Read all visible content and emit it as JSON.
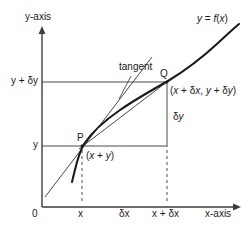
{
  "figure": {
    "colors": {
      "axis": "#3d3d3d",
      "curve": "#1a1a1a",
      "tangent": "#4a4a4a",
      "chord": "#4a4a4a",
      "guide": "#4a4a4a",
      "dashed": "#4a4a4a",
      "text": "#1a1a1a",
      "background": "#ffffff"
    },
    "axes": {
      "y_axis_label": "y-axis",
      "x_axis_label": "x-axis",
      "origin_label": "0"
    },
    "curve_label": "y = f(x)",
    "tangent_label": "tangent",
    "points": {
      "p_label": "P",
      "q_label": "Q",
      "p_coords_label": "(x + y)",
      "q_coords_label": "(x + δx, y + δy)"
    },
    "y_ticks": [
      {
        "label": "y + δy",
        "value": "y+dy"
      },
      {
        "label": "y",
        "value": "y"
      }
    ],
    "x_ticks": [
      {
        "label": "x",
        "value": "x"
      },
      {
        "label": "δx",
        "value": "dx"
      },
      {
        "label": "x + δx",
        "value": "x+dx"
      }
    ],
    "increments": {
      "delta_y_label": "δy",
      "delta_x_label": "δx"
    }
  },
  "chart_data": {
    "type": "line",
    "title": "y = f(x)",
    "xlabel": "x-axis",
    "ylabel": "y-axis",
    "grid": false,
    "legend": "none",
    "annotations": [
      "tangent",
      "P",
      "Q",
      "(x + y)",
      "(x + δx, y + δy)",
      "δy",
      "δx"
    ],
    "xtick_labels": [
      "0",
      "x",
      "δx",
      "x + δx"
    ],
    "ytick_labels": [
      "y",
      "y + δy"
    ],
    "series": [
      {
        "name": "y = f(x)",
        "points": [
          [
            72,
            182
          ],
          [
            76,
            168
          ],
          [
            80,
            153
          ],
          [
            84,
            141
          ],
          [
            90,
            131
          ],
          [
            98,
            122
          ],
          [
            108,
            113
          ],
          [
            120,
            105
          ],
          [
            134,
            97
          ],
          [
            150,
            89
          ],
          [
            166,
            82
          ],
          [
            182,
            73
          ],
          [
            198,
            62
          ],
          [
            212,
            50
          ],
          [
            226,
            38
          ],
          [
            238,
            25
          ]
        ]
      },
      {
        "name": "chord-PQ",
        "points": [
          [
            82,
            146
          ],
          [
            166,
            82
          ]
        ]
      },
      {
        "name": "tangent-at-P",
        "points": [
          [
            45,
            197
          ],
          [
            152,
            57
          ]
        ]
      }
    ]
  }
}
